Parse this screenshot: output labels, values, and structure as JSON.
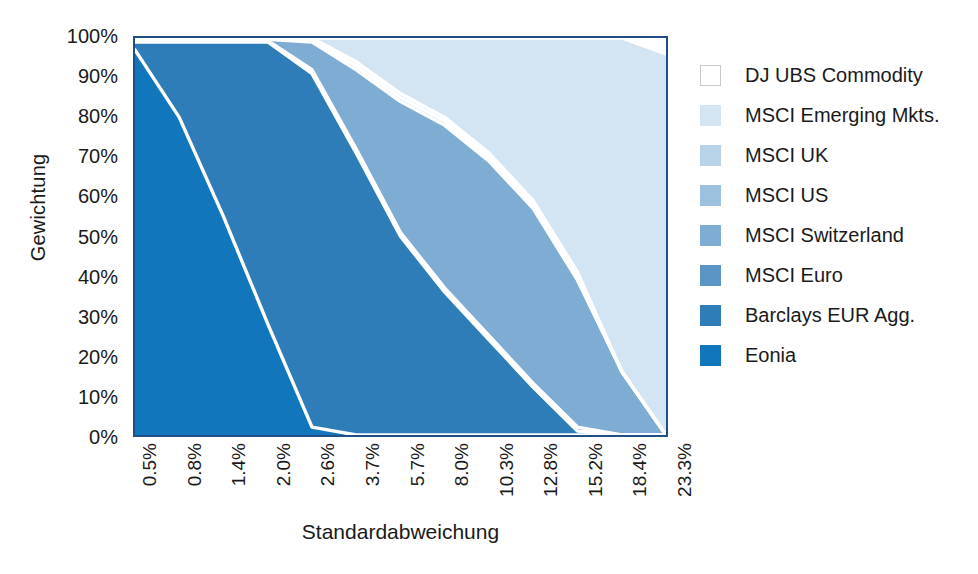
{
  "chart_data": {
    "type": "area",
    "title": "",
    "xlabel": "Standardabweichung",
    "ylabel": "Gewichtung",
    "stacked": true,
    "normalized": true,
    "grid": false,
    "legend_position": "right",
    "ylim": [
      0,
      100
    ],
    "ytick_labels": [
      "100%",
      "90%",
      "80%",
      "70%",
      "60%",
      "50%",
      "40%",
      "30%",
      "20%",
      "10%",
      "0%"
    ],
    "ytick_values": [
      100,
      90,
      80,
      70,
      60,
      50,
      40,
      30,
      20,
      10,
      0
    ],
    "categories": [
      "0.5%",
      "0.8%",
      "1.4%",
      "2.0%",
      "2.6%",
      "3.7%",
      "5.7%",
      "8.0%",
      "10.3%",
      "12.8%",
      "15.2%",
      "18.4%",
      "23.3%"
    ],
    "x_values": [
      0.5,
      0.8,
      1.4,
      2.0,
      2.6,
      3.7,
      5.7,
      8.0,
      10.3,
      12.8,
      15.2,
      18.4,
      23.3
    ],
    "series": [
      {
        "name": "Eonia",
        "color": "#1276bd",
        "values": [
          97,
          80,
          55,
          28,
          2,
          0,
          0,
          0,
          0,
          0,
          0,
          0,
          0
        ]
      },
      {
        "name": "Barclays EUR Agg.",
        "color": "#2e7cb8",
        "values": [
          2,
          19,
          44,
          71,
          89,
          71,
          50,
          36,
          24,
          12,
          1,
          0,
          0
        ]
      },
      {
        "name": "MSCI Euro",
        "color": "#5b95c6",
        "values": [
          0.4,
          0.3,
          0.3,
          0.3,
          1,
          1,
          1,
          1,
          1,
          1,
          1,
          0,
          0
        ]
      },
      {
        "name": "MSCI Switzerland",
        "color": "#7facd3",
        "values": [
          0.4,
          0.4,
          0.4,
          0.4,
          7,
          20,
          33,
          41,
          44,
          44,
          37,
          16,
          0
        ]
      },
      {
        "name": "MSCI US",
        "color": "#9cc0de",
        "values": [
          0.1,
          0.1,
          0.1,
          0.1,
          0.5,
          1,
          1,
          1,
          1,
          1,
          1,
          0,
          0
        ]
      },
      {
        "name": "MSCI UK",
        "color": "#b8d2e8",
        "values": [
          0.1,
          0.1,
          0.1,
          0.1,
          0.5,
          1,
          1,
          1,
          1,
          1,
          1,
          0,
          0
        ]
      },
      {
        "name": "MSCI Emerging Mkts.",
        "color": "#d3e4f2",
        "values": [
          0,
          0.1,
          0.1,
          0.1,
          0,
          6,
          14,
          20,
          29,
          41,
          59,
          84,
          96
        ]
      },
      {
        "name": "DJ UBS Commodity",
        "color": "#ffffff",
        "values": [
          0,
          0,
          0,
          0,
          0,
          0,
          0,
          0,
          0,
          0,
          0,
          0,
          4
        ]
      }
    ],
    "legend_entries": [
      {
        "label": "DJ UBS Commodity",
        "color": "#ffffff"
      },
      {
        "label": "MSCI Emerging Mkts.",
        "color": "#d3e4f2"
      },
      {
        "label": "MSCI UK",
        "color": "#b8d2e8"
      },
      {
        "label": "MSCI US",
        "color": "#9cc0de"
      },
      {
        "label": "MSCI Switzerland",
        "color": "#7facd3"
      },
      {
        "label": "MSCI Euro",
        "color": "#5b95c6"
      },
      {
        "label": "Barclays EUR Agg.",
        "color": "#2e7cb8"
      },
      {
        "label": "Eonia",
        "color": "#1276bd"
      }
    ],
    "colors": {
      "plot_border": "#1f4f85",
      "separator_line": "#ffffff",
      "text": "#1a1a1a",
      "background": "#ffffff"
    }
  }
}
